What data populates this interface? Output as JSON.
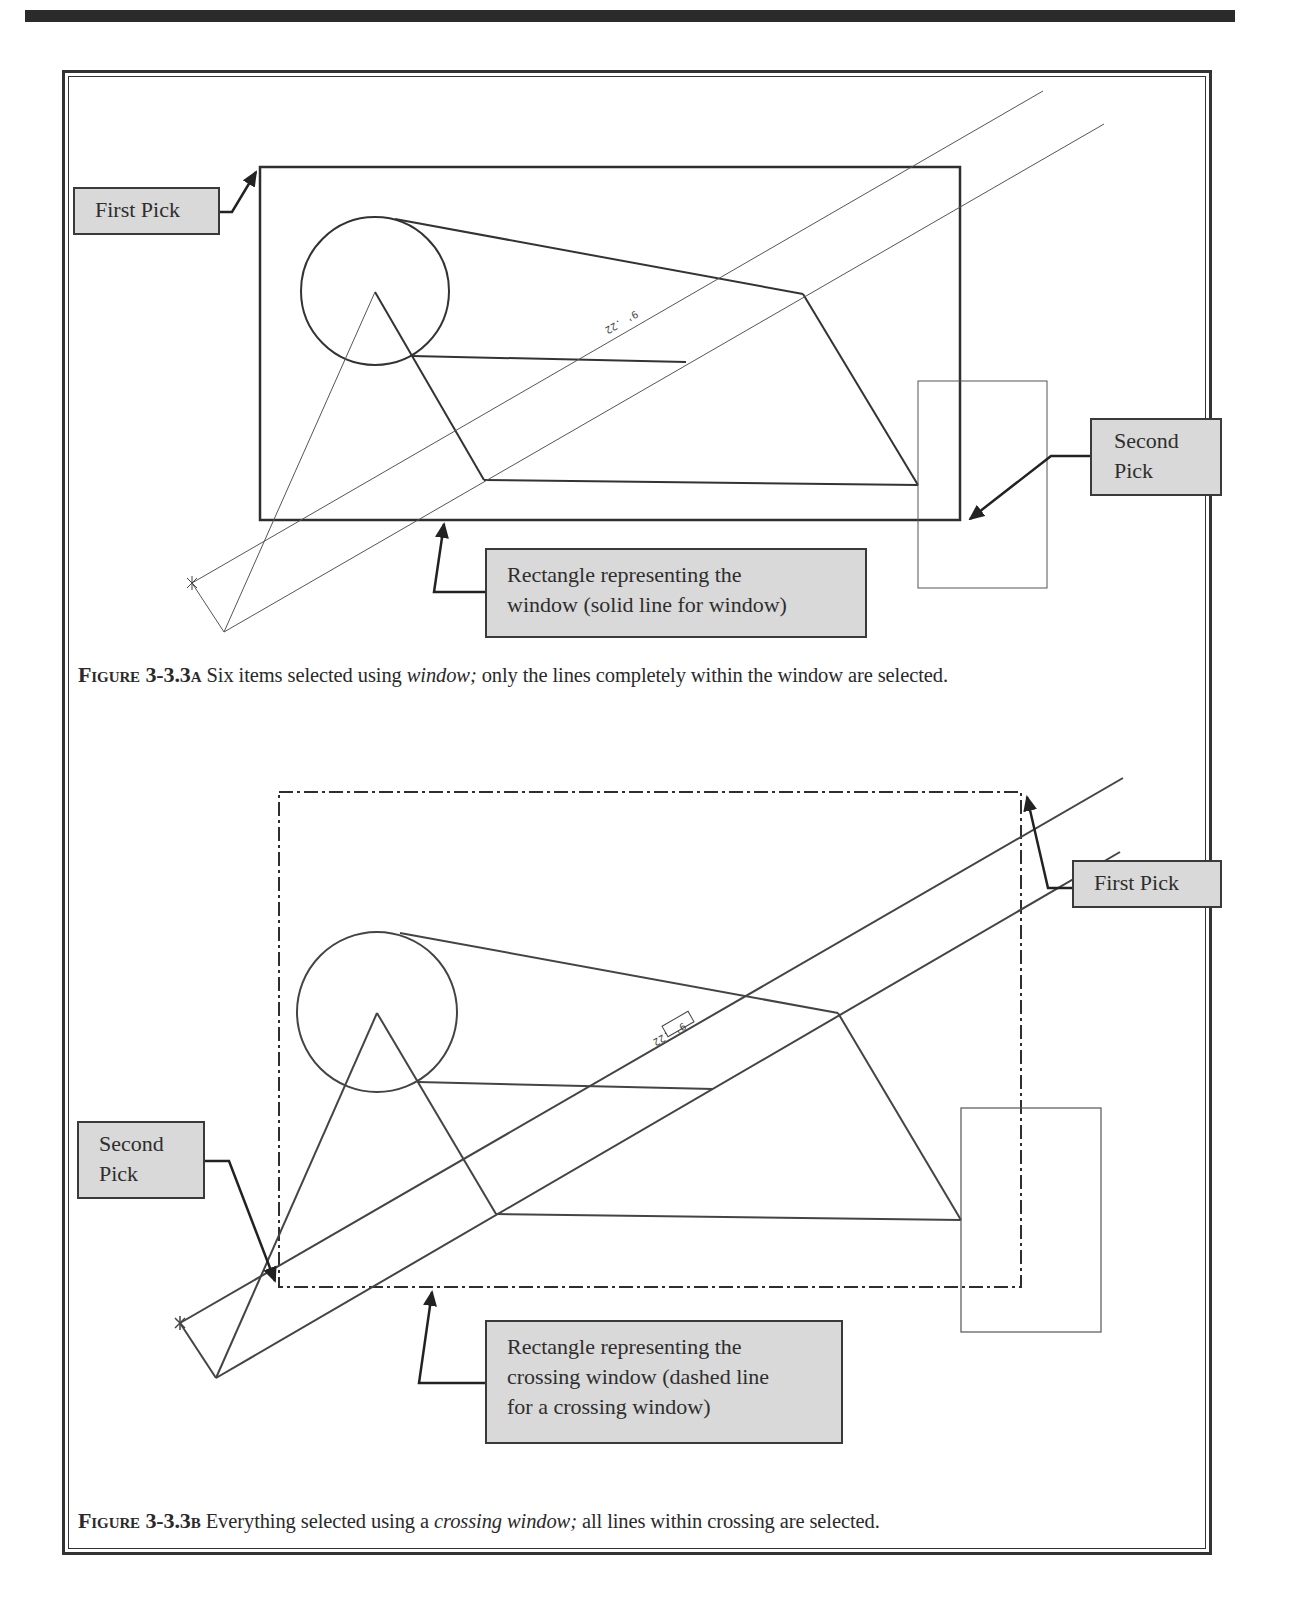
{
  "page": {
    "header_rule": true
  },
  "figure_a": {
    "callouts": {
      "first_pick": "First Pick",
      "second_pick_line1": "Second",
      "second_pick_line2": "Pick",
      "window_line1": "Rectangle representing the",
      "window_line2": "window (solid line for window)"
    },
    "dimension_label": "9' .22",
    "caption": {
      "figure_number": "Figure 3-3.3a",
      "text_before": " Six items selected using ",
      "emphasis": "window;",
      "text_after": " only the lines completely within the window are selected."
    }
  },
  "figure_b": {
    "callouts": {
      "first_pick": "First Pick",
      "second_pick_line1": "Second",
      "second_pick_line2": "Pick",
      "crossing_line1": "Rectangle representing the",
      "crossing_line2": "crossing window (dashed line",
      "crossing_line3": "for a crossing window)"
    },
    "dimension_label": "9' .22",
    "caption": {
      "figure_number": "Figure 3-3.3b",
      "text_before": " Everything selected using a ",
      "emphasis": "crossing window;",
      "text_after": " all lines within crossing are selected."
    }
  },
  "colors": {
    "callout_fill": "#d9d9d9",
    "line": "#333333",
    "thin_line": "#555555"
  }
}
